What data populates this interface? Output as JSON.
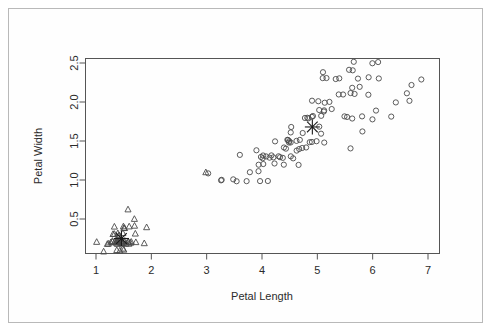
{
  "figure": {
    "background_color": "#ffffff",
    "border_color": "#b9b9b9",
    "plot_frame_color": "#555555",
    "marker_color": "#4a4a4a"
  },
  "axes": {
    "x": {
      "title": "Petal Length",
      "ticks": [
        "1",
        "2",
        "3",
        "4",
        "5",
        "6",
        "7"
      ],
      "tick_values": [
        1,
        2,
        3,
        4,
        5,
        6,
        7
      ],
      "range": [
        0.75,
        7.25
      ]
    },
    "y": {
      "title": "Petal Width",
      "ticks": [
        "0.5",
        "1.0",
        "1.5",
        "2.0",
        "2.5"
      ],
      "tick_values": [
        0.5,
        1.0,
        1.5,
        2.0,
        2.5
      ],
      "range": [
        0.0,
        2.65
      ]
    }
  },
  "chart_data": {
    "type": "scatter",
    "title": "",
    "xlabel": "Petal Length",
    "ylabel": "Petal Width",
    "xlim": [
      0.75,
      7.25
    ],
    "ylim": [
      0.0,
      2.65
    ],
    "grid": false,
    "legend": "none",
    "series": [
      {
        "name": "cluster-1",
        "marker": "triangle",
        "x": [
          1.4,
          1.4,
          1.3,
          1.5,
          1.4,
          1.7,
          1.4,
          1.5,
          1.4,
          1.5,
          1.5,
          1.6,
          1.4,
          1.1,
          1.2,
          1.5,
          1.3,
          1.4,
          1.7,
          1.5,
          1.7,
          1.5,
          1.0,
          1.7,
          1.9,
          1.6,
          1.6,
          1.5,
          1.4,
          1.6,
          1.6,
          1.5,
          1.5,
          1.4,
          1.5,
          1.2,
          1.3,
          1.4,
          1.3,
          1.5,
          1.3,
          1.3,
          1.3,
          1.6,
          1.9,
          1.4,
          1.6,
          1.4,
          1.5,
          1.4,
          3.0
        ],
        "y": [
          0.2,
          0.2,
          0.2,
          0.2,
          0.2,
          0.4,
          0.3,
          0.2,
          0.2,
          0.1,
          0.2,
          0.2,
          0.1,
          0.1,
          0.2,
          0.4,
          0.4,
          0.3,
          0.3,
          0.3,
          0.2,
          0.4,
          0.2,
          0.5,
          0.2,
          0.2,
          0.4,
          0.2,
          0.2,
          0.2,
          0.2,
          0.4,
          0.1,
          0.2,
          0.2,
          0.2,
          0.2,
          0.1,
          0.2,
          0.2,
          0.3,
          0.3,
          0.2,
          0.6,
          0.4,
          0.3,
          0.2,
          0.2,
          0.2,
          0.2,
          1.1
        ]
      },
      {
        "name": "cluster-2",
        "marker": "circle",
        "x": [
          4.7,
          4.5,
          4.9,
          4.0,
          4.6,
          4.5,
          4.7,
          3.3,
          4.6,
          3.9,
          3.5,
          4.2,
          4.0,
          4.7,
          3.6,
          4.4,
          4.5,
          4.1,
          4.5,
          3.9,
          4.8,
          4.0,
          4.9,
          4.7,
          4.3,
          4.4,
          4.8,
          5.0,
          4.5,
          3.5,
          3.8,
          3.7,
          3.9,
          5.1,
          4.5,
          4.5,
          4.7,
          4.4,
          4.1,
          4.0,
          4.4,
          4.6,
          4.0,
          3.3,
          4.2,
          4.2,
          4.2,
          4.3,
          3.0,
          4.1,
          6.0,
          5.1,
          5.9,
          5.6,
          5.8,
          6.6,
          4.5,
          6.3,
          5.8,
          6.1,
          5.1,
          5.3,
          5.5,
          5.0,
          5.1,
          5.3,
          5.5,
          6.7,
          6.9,
          5.0,
          5.7,
          4.9,
          6.7,
          4.9,
          5.7,
          6.0,
          4.8,
          4.9,
          5.6,
          5.8,
          6.1,
          6.4,
          5.6,
          5.1,
          5.6,
          6.1,
          5.6,
          5.5,
          4.8,
          5.4,
          5.6,
          5.1,
          5.1,
          5.9,
          5.7,
          5.2,
          5.0,
          5.2,
          5.4,
          5.1
        ],
        "y": [
          1.4,
          1.5,
          1.5,
          1.3,
          1.5,
          1.3,
          1.6,
          1.0,
          1.3,
          1.4,
          1.0,
          1.5,
          1.0,
          1.4,
          1.3,
          1.4,
          1.5,
          1.0,
          1.5,
          1.1,
          1.8,
          1.3,
          1.5,
          1.2,
          1.3,
          1.4,
          1.4,
          1.7,
          1.5,
          1.0,
          1.1,
          1.0,
          1.2,
          1.6,
          1.5,
          1.6,
          1.5,
          1.3,
          1.3,
          1.3,
          1.2,
          1.4,
          1.2,
          1.0,
          1.3,
          1.2,
          1.3,
          1.3,
          1.1,
          1.3,
          2.5,
          1.9,
          2.1,
          1.8,
          2.2,
          2.1,
          1.7,
          1.8,
          1.8,
          2.5,
          2.0,
          1.9,
          2.1,
          2.0,
          2.4,
          2.3,
          1.8,
          2.2,
          2.3,
          1.5,
          2.3,
          2.0,
          2.0,
          1.8,
          2.1,
          1.8,
          1.8,
          1.8,
          2.1,
          1.6,
          1.9,
          2.0,
          2.2,
          1.5,
          1.4,
          2.3,
          2.4,
          1.8,
          1.8,
          2.1,
          2.4,
          2.3,
          1.9,
          2.3,
          2.5,
          2.3,
          1.9,
          2.0,
          2.3,
          1.8
        ]
      },
      {
        "name": "centroids",
        "marker": "asterisk",
        "x": [
          1.46,
          4.91
        ],
        "y": [
          0.25,
          1.68
        ]
      }
    ]
  }
}
